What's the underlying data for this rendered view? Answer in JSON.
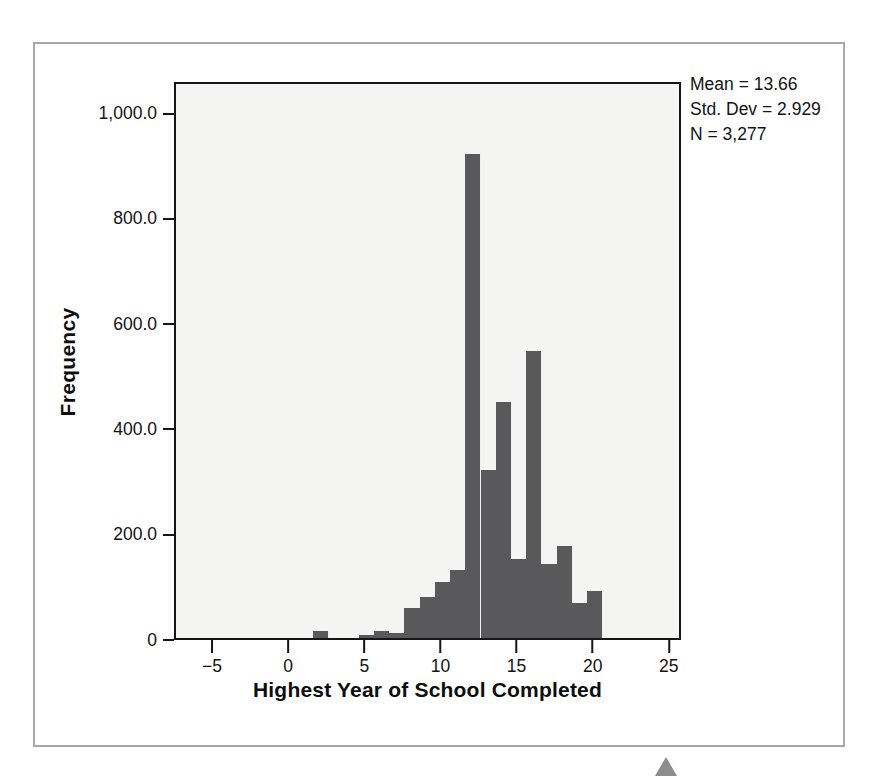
{
  "figure": {
    "stats": {
      "mean_line": "Mean = 13.66",
      "stddev_line": "Std. Dev = 2.929",
      "n_line": "N = 3,277"
    },
    "marker_icon": "triangle-up-icon"
  },
  "chart_data": {
    "type": "bar",
    "title": "",
    "xlabel": "Highest Year of School Completed",
    "ylabel": "Frequency",
    "xlim": [
      -7.5,
      25.8
    ],
    "ylim": [
      0,
      1060
    ],
    "grid": false,
    "legend": null,
    "bar_color": "#59595b",
    "plot_background": "#f4f4f2",
    "bin_width": 1,
    "x_ticks": [
      -5,
      0,
      5,
      10,
      15,
      20,
      25
    ],
    "x_tick_labels": [
      "−5",
      "0",
      "5",
      "10",
      "15",
      "20",
      "25"
    ],
    "y_ticks": [
      0,
      200,
      400,
      600,
      800,
      1000
    ],
    "y_tick_labels": [
      "0",
      "200.0",
      "400.0",
      "600.0",
      "800.0",
      "1,000.0"
    ],
    "categories": [
      2,
      5,
      6,
      7,
      8,
      9,
      10,
      11,
      12,
      13,
      14,
      15,
      16,
      17,
      18,
      19,
      20
    ],
    "values": [
      14,
      6,
      13,
      10,
      57,
      77,
      106,
      129,
      920,
      320,
      448,
      151,
      545,
      141,
      174,
      66,
      89
    ],
    "annotations": [
      "Mean = 13.66",
      "Std. Dev = 2.929",
      "N = 3,277"
    ]
  }
}
